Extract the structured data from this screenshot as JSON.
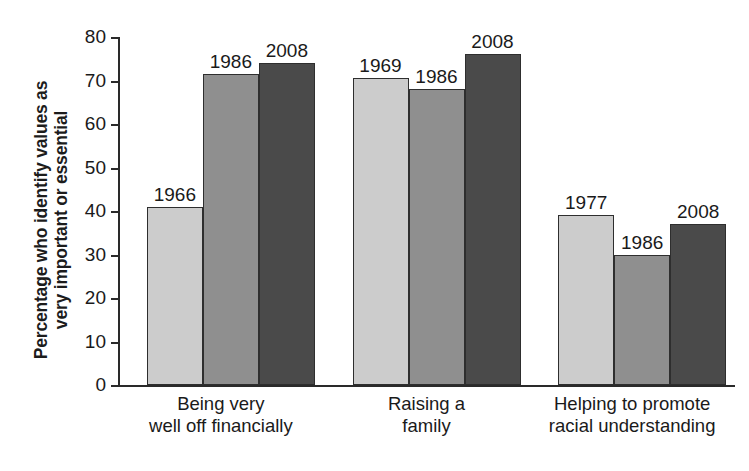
{
  "chart_data": {
    "type": "bar",
    "title": "",
    "subtitle": "",
    "xlabel": "",
    "ylabel": "Percentage who identify values as very important or essential",
    "ylabel_lines": [
      "Percentage who identify values as",
      "very important or essential"
    ],
    "ylim": [
      0,
      80
    ],
    "yticks": [
      0,
      10,
      20,
      30,
      40,
      50,
      60,
      70,
      80
    ],
    "ytick_labels": [
      "0",
      "10",
      "20",
      "30",
      "40",
      "50",
      "60",
      "70",
      "80"
    ],
    "grid": false,
    "legend": "none",
    "categories": [
      "Being very well off financially",
      "Raising a family",
      "Helping to promote racial understanding"
    ],
    "category_label_lines": [
      [
        "Being very",
        "well off financially"
      ],
      [
        "Raising a",
        "family"
      ],
      [
        "Helping to promote",
        "racial understanding"
      ]
    ],
    "groups": [
      {
        "category": "Being very well off financially",
        "bars": [
          {
            "label": "1966",
            "value": 41,
            "color": "#cccccc"
          },
          {
            "label": "1986",
            "value": 71.5,
            "color": "#8f8f8f"
          },
          {
            "label": "2008",
            "value": 74,
            "color": "#4a4a4a"
          }
        ]
      },
      {
        "category": "Raising a family",
        "bars": [
          {
            "label": "1969",
            "value": 70.5,
            "color": "#cccccc"
          },
          {
            "label": "1986",
            "value": 68,
            "color": "#8f8f8f"
          },
          {
            "label": "2008",
            "value": 76,
            "color": "#4a4a4a"
          }
        ]
      },
      {
        "category": "Helping to promote racial understanding",
        "bars": [
          {
            "label": "1977",
            "value": 39,
            "color": "#cccccc"
          },
          {
            "label": "1986",
            "value": 30,
            "color": "#8f8f8f"
          },
          {
            "label": "2008",
            "value": 37,
            "color": "#4a4a4a"
          }
        ]
      }
    ],
    "colors": {
      "series_light": "#cccccc",
      "series_medium": "#8f8f8f",
      "series_dark": "#4a4a4a",
      "axis": "#2a2a2a",
      "text": "#1a1a1a",
      "background": "#ffffff"
    }
  }
}
